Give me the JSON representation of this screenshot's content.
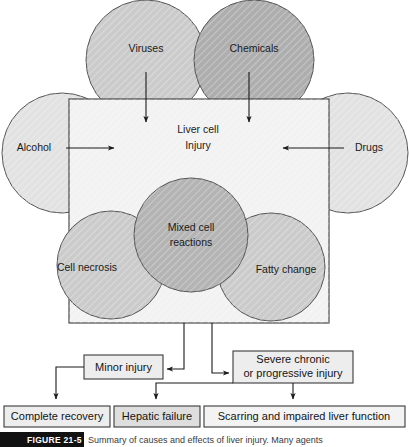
{
  "figure": {
    "number": "FIGURE 21-5",
    "caption": "Summary of causes and effects of liver injury. Many agents",
    "caption_bar_color": "#111111"
  },
  "colors": {
    "circle_light": "#e2e2e2",
    "circle_mid": "#c9c9c9",
    "circle_dark": "#adadad",
    "box_fill": "#f2f2f2",
    "outline": "#4a4a4a",
    "text": "#1a1a1a",
    "arrow": "#1a1a1a",
    "result_box_fill": "#ededed"
  },
  "causes": [
    {
      "id": "viruses",
      "label": "Viruses",
      "shade": "circle_mid",
      "position": "top-left"
    },
    {
      "id": "chemicals",
      "label": "Chemicals",
      "shade": "circle_dark",
      "position": "top-right"
    },
    {
      "id": "alcohol",
      "label": "Alcohol",
      "shade": "circle_light",
      "position": "left"
    },
    {
      "id": "drugs",
      "label": "Drugs",
      "shade": "circle_light",
      "position": "right"
    }
  ],
  "central_box": {
    "label_line1": "Liver cell",
    "label_line2": "Injury"
  },
  "effects": [
    {
      "id": "cell-necrosis",
      "label": "Cell necrosis",
      "shade": "circle_mid",
      "position": "bottom-left"
    },
    {
      "id": "mixed-cell",
      "label_line1": "Mixed cell",
      "label_line2": "reactions",
      "shade": "circle_dark",
      "position": "bottom-center"
    },
    {
      "id": "fatty-change",
      "label": "Fatty change",
      "shade": "circle_mid",
      "position": "bottom-right"
    }
  ],
  "flow": {
    "minor_injury": "Minor injury",
    "severe_line1": "Severe chronic",
    "severe_line2": "or progressive injury"
  },
  "outcomes": [
    {
      "id": "complete-recovery",
      "label": "Complete recovery"
    },
    {
      "id": "hepatic-failure",
      "label": "Hepatic failure"
    },
    {
      "id": "scarring",
      "label": "Scarring and impaired liver function"
    }
  ]
}
